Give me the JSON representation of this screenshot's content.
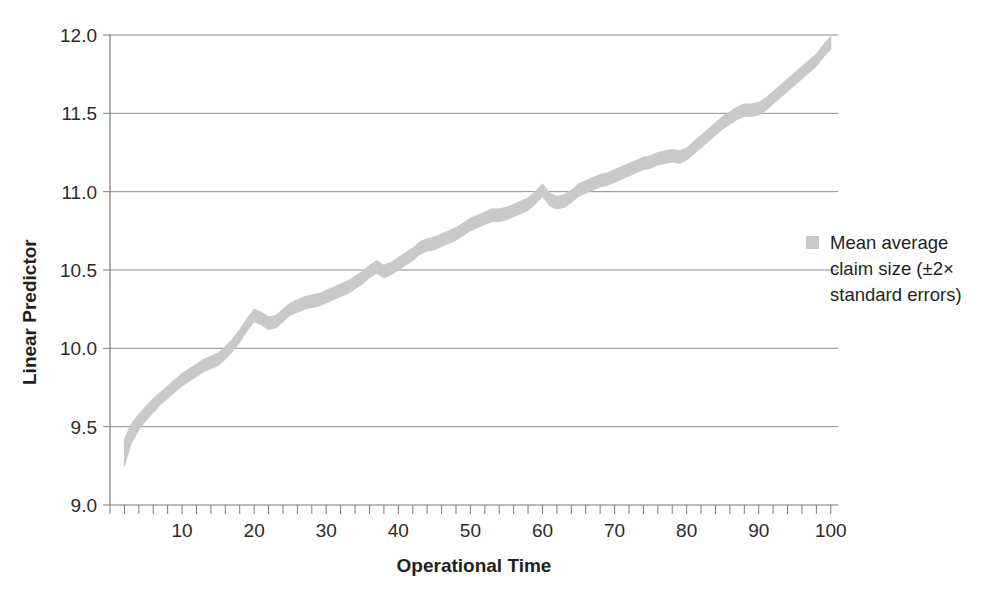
{
  "chart_data": {
    "type": "area",
    "title": "",
    "subtitle": "",
    "xlabel": "Operational Time",
    "ylabel": "Linear Predictor",
    "xlim": [
      0,
      101
    ],
    "ylim": [
      9.0,
      12.0
    ],
    "grid": true,
    "legend_position": "right",
    "y_ticks": [
      "9.0",
      "9.5",
      "10.0",
      "10.5",
      "11.0",
      "11.5",
      "12.0"
    ],
    "y_tick_values": [
      9.0,
      9.5,
      10.0,
      10.5,
      11.0,
      11.5,
      12.0
    ],
    "x_ticks": [
      "10",
      "20",
      "30",
      "40",
      "50",
      "60",
      "70",
      "80",
      "90",
      "100"
    ],
    "x_tick_values": [
      10,
      20,
      30,
      40,
      50,
      60,
      70,
      80,
      90,
      100
    ],
    "x_minor_tick_step": 2,
    "band_color": "#c9c9c9",
    "legend": [
      {
        "marker": "square",
        "color": "#c9c9c9",
        "label": "Mean average claim size (±2× standard errors)",
        "line1": "Mean average",
        "line2": "claim size (±2×",
        "line3": "standard errors)"
      }
    ],
    "series": [
      {
        "name": "Mean average claim size (±2× standard errors)",
        "x": [
          2,
          3,
          4,
          5,
          6,
          7,
          8,
          9,
          10,
          11,
          12,
          13,
          14,
          15,
          16,
          17,
          18,
          19,
          20,
          21,
          22,
          23,
          24,
          25,
          26,
          27,
          28,
          29,
          30,
          31,
          32,
          33,
          34,
          35,
          36,
          37,
          38,
          39,
          40,
          41,
          42,
          43,
          44,
          45,
          46,
          47,
          48,
          49,
          50,
          51,
          52,
          53,
          54,
          55,
          56,
          57,
          58,
          59,
          60,
          61,
          62,
          63,
          64,
          65,
          66,
          67,
          68,
          69,
          70,
          71,
          72,
          73,
          74,
          75,
          76,
          77,
          78,
          79,
          80,
          81,
          82,
          83,
          84,
          85,
          86,
          87,
          88,
          89,
          90,
          91,
          92,
          93,
          94,
          95,
          96,
          97,
          98,
          99,
          100
        ],
        "mean": [
          9.33,
          9.46,
          9.53,
          9.58,
          9.63,
          9.68,
          9.72,
          9.76,
          9.8,
          9.83,
          9.86,
          9.89,
          9.91,
          9.93,
          9.97,
          10.02,
          10.08,
          10.15,
          10.21,
          10.19,
          10.16,
          10.17,
          10.21,
          10.25,
          10.27,
          10.29,
          10.3,
          10.31,
          10.33,
          10.35,
          10.37,
          10.39,
          10.42,
          10.45,
          10.49,
          10.52,
          10.49,
          10.51,
          10.54,
          10.57,
          10.6,
          10.64,
          10.66,
          10.67,
          10.69,
          10.71,
          10.73,
          10.76,
          10.79,
          10.81,
          10.83,
          10.85,
          10.85,
          10.86,
          10.88,
          10.9,
          10.92,
          10.96,
          11.01,
          10.95,
          10.93,
          10.94,
          10.97,
          11.01,
          11.03,
          11.05,
          11.07,
          11.08,
          11.1,
          11.12,
          11.14,
          11.16,
          11.18,
          11.19,
          11.21,
          11.22,
          11.23,
          11.22,
          11.24,
          11.28,
          11.32,
          11.36,
          11.4,
          11.44,
          11.47,
          11.5,
          11.52,
          11.52,
          11.53,
          11.56,
          11.6,
          11.64,
          11.68,
          11.72,
          11.76,
          11.8,
          11.84,
          11.9,
          11.95
        ],
        "lower": [
          9.25,
          9.4,
          9.48,
          9.54,
          9.59,
          9.64,
          9.68,
          9.72,
          9.76,
          9.79,
          9.82,
          9.85,
          9.87,
          9.89,
          9.93,
          9.98,
          10.04,
          10.11,
          10.17,
          10.15,
          10.12,
          10.13,
          10.17,
          10.21,
          10.23,
          10.25,
          10.26,
          10.27,
          10.29,
          10.31,
          10.33,
          10.35,
          10.38,
          10.41,
          10.45,
          10.48,
          10.45,
          10.47,
          10.5,
          10.53,
          10.56,
          10.6,
          10.62,
          10.63,
          10.65,
          10.67,
          10.69,
          10.72,
          10.75,
          10.77,
          10.79,
          10.81,
          10.81,
          10.82,
          10.84,
          10.86,
          10.88,
          10.92,
          10.97,
          10.91,
          10.89,
          10.9,
          10.93,
          10.97,
          10.99,
          11.01,
          11.03,
          11.04,
          11.06,
          11.08,
          11.1,
          11.12,
          11.14,
          11.15,
          11.17,
          11.18,
          11.19,
          11.18,
          11.2,
          11.24,
          11.28,
          11.32,
          11.36,
          11.4,
          11.43,
          11.46,
          11.48,
          11.48,
          11.49,
          11.52,
          11.56,
          11.6,
          11.64,
          11.68,
          11.72,
          11.76,
          11.8,
          11.86,
          11.91
        ],
        "upper": [
          9.42,
          9.52,
          9.58,
          9.63,
          9.68,
          9.72,
          9.76,
          9.8,
          9.84,
          9.87,
          9.9,
          9.93,
          9.95,
          9.97,
          10.01,
          10.06,
          10.12,
          10.19,
          10.25,
          10.23,
          10.2,
          10.21,
          10.25,
          10.29,
          10.31,
          10.33,
          10.34,
          10.35,
          10.37,
          10.39,
          10.41,
          10.43,
          10.46,
          10.49,
          10.53,
          10.56,
          10.53,
          10.55,
          10.58,
          10.61,
          10.64,
          10.68,
          10.7,
          10.71,
          10.73,
          10.75,
          10.77,
          10.8,
          10.83,
          10.85,
          10.87,
          10.89,
          10.89,
          10.9,
          10.92,
          10.94,
          10.96,
          11.0,
          11.05,
          10.99,
          10.97,
          10.98,
          11.01,
          11.05,
          11.07,
          11.09,
          11.11,
          11.12,
          11.14,
          11.16,
          11.18,
          11.2,
          11.22,
          11.23,
          11.25,
          11.26,
          11.27,
          11.26,
          11.28,
          11.32,
          11.36,
          11.4,
          11.44,
          11.48,
          11.51,
          11.54,
          11.56,
          11.56,
          11.57,
          11.6,
          11.64,
          11.68,
          11.72,
          11.76,
          11.8,
          11.84,
          11.88,
          11.94,
          11.99
        ]
      }
    ]
  }
}
